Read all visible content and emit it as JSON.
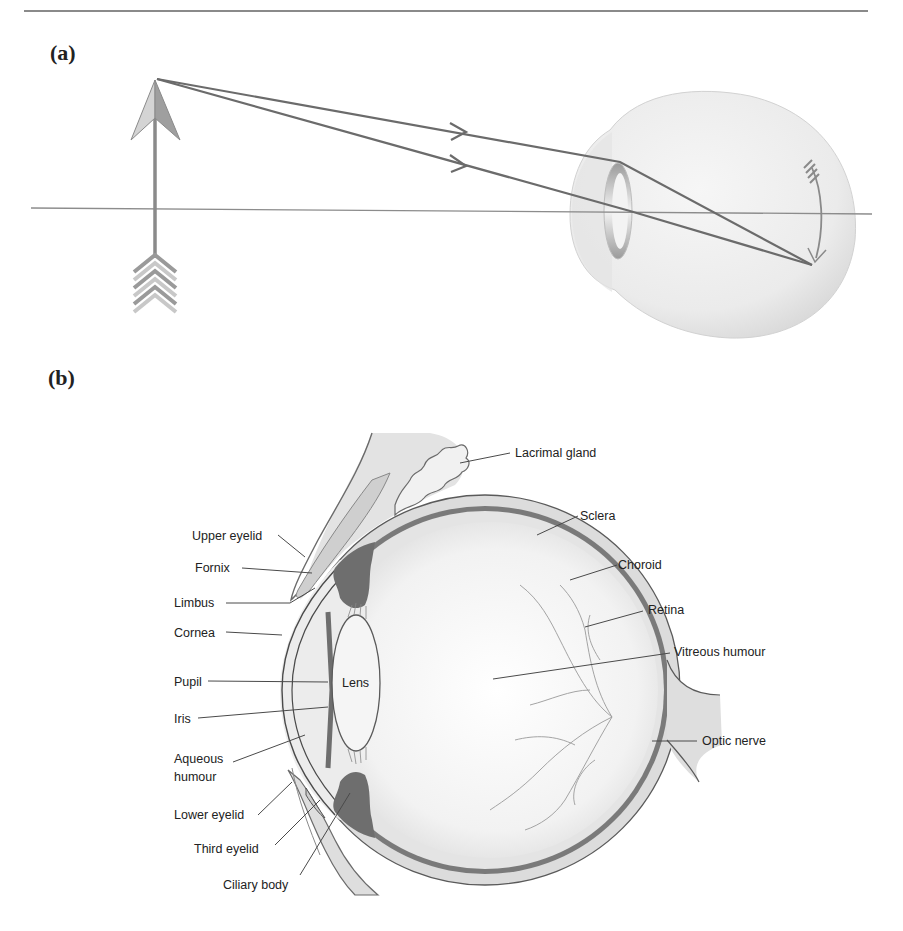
{
  "figure": {
    "panel_a": {
      "label": "(a)",
      "description": "Ray diagram: light rays from the tip of an upright arrow object pass through the eye lens and converge to form an inverted image on the retina",
      "elements": [
        "object-arrow",
        "optical-axis",
        "ray-1",
        "ray-2",
        "eyeball",
        "lens",
        "inverted-image-arrow"
      ]
    },
    "panel_b": {
      "label": "(b)",
      "lens_label": "Lens",
      "left_labels": [
        "Upper eyelid",
        "Fornix",
        "Limbus",
        "Cornea",
        "Pupil",
        "Iris",
        "Aqueous humour",
        "Lower eyelid",
        "Third eyelid",
        "Ciliary body"
      ],
      "right_labels": [
        "Lacrimal gland",
        "Sclera",
        "Choroid",
        "Retina",
        "Vitreous humour",
        "Optic nerve"
      ]
    },
    "colors": {
      "line": "#6b6b6b",
      "rule": "#8a8a8a",
      "eye_fill": "#ececec",
      "choroid": "#7a7a7a",
      "iris": "#6e6e6e"
    }
  },
  "labels": {
    "upper_eyelid": "Upper eyelid",
    "fornix": "Fornix",
    "limbus": "Limbus",
    "cornea": "Cornea",
    "pupil": "Pupil",
    "iris": "Iris",
    "aqueous_1": "Aqueous",
    "aqueous_2": "humour",
    "lower_eyelid": "Lower eyelid",
    "third_eyelid": "Third eyelid",
    "ciliary_body": "Ciliary body",
    "lacrimal_gland": "Lacrimal gland",
    "sclera": "Sclera",
    "choroid": "Choroid",
    "retina": "Retina",
    "vitreous_humour": "Vitreous humour",
    "optic_nerve": "Optic nerve",
    "lens": "Lens"
  }
}
